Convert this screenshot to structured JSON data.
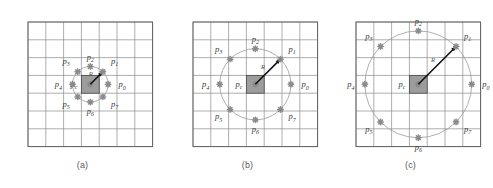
{
  "figure": {
    "background": "#ffffff",
    "grid_color": "#8c8c8c",
    "circle_color": "#9a9a9a",
    "ray_color": "#111111",
    "center_fill": "#9d9d9d",
    "marker_color": "#8a8a8a",
    "radius_label": "R"
  },
  "panels": [
    {
      "id": "a",
      "caption": "(a)",
      "grid": {
        "cols": 7,
        "rows": 7
      },
      "radius_cells": 1,
      "center_label": "p",
      "center_sub": "c",
      "points": [
        {
          "name": "p0",
          "base": "p",
          "sub": "0",
          "angle_deg": 0
        },
        {
          "name": "p1",
          "base": "p",
          "sub": "1",
          "angle_deg": 45
        },
        {
          "name": "p2",
          "base": "p",
          "sub": "2",
          "angle_deg": 90
        },
        {
          "name": "p3",
          "base": "p",
          "sub": "3",
          "angle_deg": 135
        },
        {
          "name": "p4",
          "base": "p",
          "sub": "4",
          "angle_deg": 180
        },
        {
          "name": "p5",
          "base": "p",
          "sub": "5",
          "angle_deg": 225
        },
        {
          "name": "p6",
          "base": "p",
          "sub": "6",
          "angle_deg": 270
        },
        {
          "name": "p7",
          "base": "p",
          "sub": "7",
          "angle_deg": 315
        }
      ]
    },
    {
      "id": "b",
      "caption": "(b)",
      "grid": {
        "cols": 7,
        "rows": 7
      },
      "radius_cells": 2,
      "center_label": "p",
      "center_sub": "c",
      "points": [
        {
          "name": "p0",
          "base": "p",
          "sub": "0",
          "angle_deg": 0
        },
        {
          "name": "p1",
          "base": "p",
          "sub": "1",
          "angle_deg": 45
        },
        {
          "name": "p2",
          "base": "p",
          "sub": "2",
          "angle_deg": 90
        },
        {
          "name": "p3",
          "base": "p",
          "sub": "3",
          "angle_deg": 135
        },
        {
          "name": "p4",
          "base": "p",
          "sub": "4",
          "angle_deg": 180
        },
        {
          "name": "p5",
          "base": "p",
          "sub": "5",
          "angle_deg": 225
        },
        {
          "name": "p6",
          "base": "p",
          "sub": "6",
          "angle_deg": 270
        },
        {
          "name": "p7",
          "base": "p",
          "sub": "7",
          "angle_deg": 315
        }
      ]
    },
    {
      "id": "c",
      "caption": "(c)",
      "grid": {
        "cols": 7,
        "rows": 7
      },
      "radius_cells": 3,
      "center_label": "p",
      "center_sub": "c",
      "points": [
        {
          "name": "p0",
          "base": "p",
          "sub": "0",
          "angle_deg": 0
        },
        {
          "name": "p1",
          "base": "p",
          "sub": "1",
          "angle_deg": 45
        },
        {
          "name": "p2",
          "base": "p",
          "sub": "2",
          "angle_deg": 90
        },
        {
          "name": "p3",
          "base": "p",
          "sub": "3",
          "angle_deg": 135
        },
        {
          "name": "p4",
          "base": "p",
          "sub": "4",
          "angle_deg": 180
        },
        {
          "name": "p5",
          "base": "p",
          "sub": "5",
          "angle_deg": 225
        },
        {
          "name": "p6",
          "base": "p",
          "sub": "6",
          "angle_deg": 270
        },
        {
          "name": "p7",
          "base": "p",
          "sub": "7",
          "angle_deg": 315
        }
      ]
    }
  ]
}
